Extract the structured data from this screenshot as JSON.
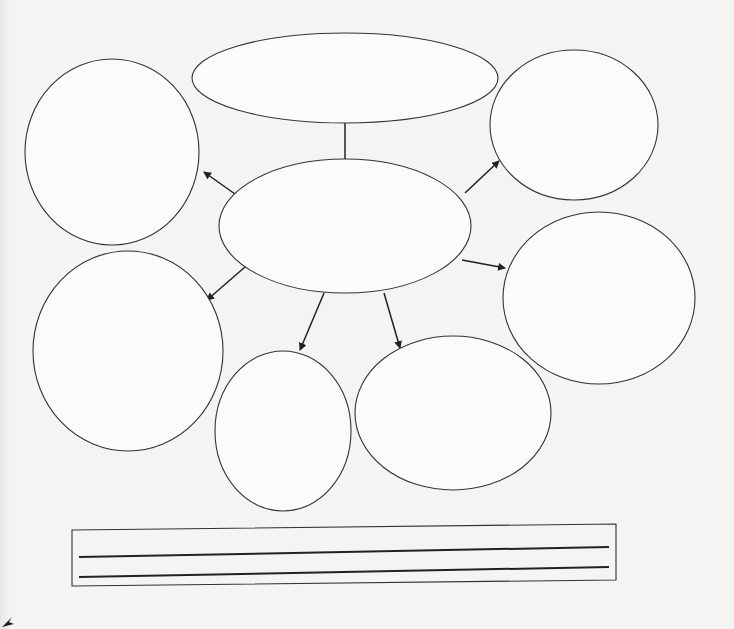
{
  "worksheet": {
    "title": "",
    "background": "#f4f4f2",
    "stroke_color": "#333333"
  },
  "diagram": {
    "type": "mind-map",
    "center": {
      "id": "center",
      "cx": 345,
      "cy": 226,
      "rx": 126,
      "ry": 67,
      "text": ""
    },
    "nodes": [
      {
        "id": "top",
        "cx": 345,
        "cy": 78,
        "rx": 153,
        "ry": 45,
        "text": ""
      },
      {
        "id": "upper-left",
        "cx": 112,
        "cy": 152,
        "rx": 87,
        "ry": 93,
        "text": ""
      },
      {
        "id": "upper-right",
        "cx": 574,
        "cy": 125,
        "rx": 84,
        "ry": 75,
        "text": ""
      },
      {
        "id": "right",
        "cx": 599,
        "cy": 298,
        "rx": 96,
        "ry": 86,
        "text": ""
      },
      {
        "id": "lower-left",
        "cx": 128,
        "cy": 351,
        "rx": 95,
        "ry": 100,
        "text": ""
      },
      {
        "id": "bottom-center",
        "cx": 283,
        "cy": 431,
        "rx": 68,
        "ry": 80,
        "text": ""
      },
      {
        "id": "bottom-right",
        "cx": 453,
        "cy": 413,
        "rx": 98,
        "ry": 77,
        "text": ""
      }
    ],
    "arrows": [
      {
        "to": "top",
        "x1": 345,
        "y1": 159,
        "x2": 345,
        "y2": 112
      },
      {
        "to": "upper-left",
        "x1": 235,
        "y1": 194,
        "x2": 204,
        "y2": 172
      },
      {
        "to": "upper-right",
        "x1": 465,
        "y1": 193,
        "x2": 499,
        "y2": 161
      },
      {
        "to": "right",
        "x1": 462,
        "y1": 260,
        "x2": 505,
        "y2": 268
      },
      {
        "to": "lower-left",
        "x1": 245,
        "y1": 267,
        "x2": 207,
        "y2": 300
      },
      {
        "to": "bottom-center",
        "x1": 324,
        "y1": 293,
        "x2": 300,
        "y2": 350
      },
      {
        "to": "bottom-right",
        "x1": 384,
        "y1": 293,
        "x2": 400,
        "y2": 348
      }
    ]
  },
  "answer_box": {
    "x": 72,
    "y": 524,
    "width": 544,
    "height": 62,
    "lines": [
      {
        "x1": 79,
        "y1": 557,
        "x2": 609,
        "y2": 547
      },
      {
        "x1": 79,
        "y1": 577,
        "x2": 609,
        "y2": 567
      }
    ],
    "text": ""
  }
}
